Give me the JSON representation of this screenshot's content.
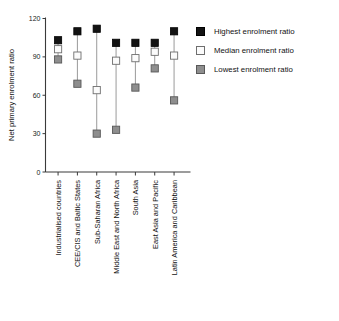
{
  "chart_data": {
    "type": "scatter",
    "title": "",
    "xlabel": "",
    "ylabel": "Net primary enrolment ratio",
    "ylim": [
      0,
      120
    ],
    "yticks": [
      0,
      30,
      60,
      90,
      120
    ],
    "grid": false,
    "legend_position": "right",
    "categories": [
      "Industrialised countries",
      "CEE/CIS and Baltic States",
      "Sub-Saharan Africa",
      "Middle East and North Africa",
      "South Asia",
      "East Asia and Pacific",
      "Latin America and Caribbean"
    ],
    "series": [
      {
        "name": "Highest enrolment ratio",
        "marker": "filled-square",
        "color": "#131313",
        "values": [
          103,
          110,
          112,
          101,
          101,
          101,
          110
        ]
      },
      {
        "name": "Median enrolment ratio",
        "marker": "open-square",
        "color": "#fbfbfb",
        "values": [
          96,
          91,
          64,
          87,
          89,
          94,
          91
        ]
      },
      {
        "name": "Lowest enrolment ratio",
        "marker": "grey-square",
        "color": "#8e8e8e",
        "values": [
          88,
          69,
          30,
          33,
          66,
          81,
          56
        ]
      }
    ]
  },
  "legend": {
    "items": [
      {
        "label": "Highest enrolment ratio",
        "swatch": "filled-square-swatch"
      },
      {
        "label": "Median enrolment ratio",
        "swatch": "open-square-swatch"
      },
      {
        "label": "Lowest enrolment ratio",
        "swatch": "grey-square-swatch"
      }
    ]
  }
}
